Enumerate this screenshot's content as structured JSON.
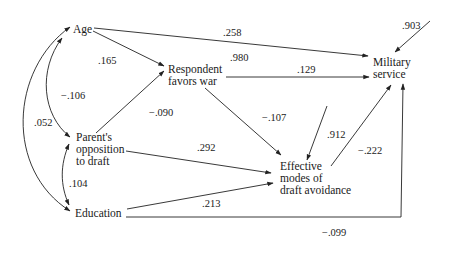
{
  "diagram": {
    "type": "path-diagram",
    "nodes": {
      "age": "Age",
      "respondent": [
        "Respondent",
        "favors war"
      ],
      "military": [
        "Military",
        "service"
      ],
      "parent": [
        "Parent's",
        "opposition",
        "to draft"
      ],
      "education": "Education",
      "effective": [
        "Effective",
        "modes of",
        "draft avoidance"
      ]
    },
    "coefficients": {
      "age_military": ".258",
      "residual_military": ".903",
      "age_respondent": ".165",
      "residual_respondent": ".980",
      "respondent_military": ".129",
      "age_parent": "−.106",
      "parent_respondent": "−.090",
      "age_education": ".052",
      "respondent_effective": "−.107",
      "parent_effective": ".292",
      "residual_effective": ".912",
      "effective_military": "−.222",
      "parent_education": ".104",
      "education_effective": ".213",
      "education_military": "−.099"
    }
  }
}
